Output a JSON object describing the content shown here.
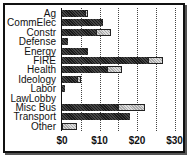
{
  "chart_data": {
    "type": "bar",
    "orientation": "horizontal",
    "stacked": true,
    "title": "",
    "xlabel": "",
    "ylabel": "",
    "categories": [
      "Ag",
      "CommElec",
      "Constr",
      "Defense",
      "Energy",
      "FIRE",
      "Health",
      "Ideology",
      "Labor",
      "LawLobby",
      "Misc Bus",
      "Transport",
      "Other"
    ],
    "series": [
      {
        "name": "dark",
        "color": "#222222",
        "values": [
          6,
          11,
          9,
          1.5,
          7,
          23,
          12,
          4,
          0.8,
          0,
          15,
          18,
          0
        ]
      },
      {
        "name": "light",
        "color": "#cccccc",
        "values": [
          1,
          0,
          4,
          0,
          0,
          4,
          4,
          1,
          0,
          0,
          7,
          0,
          4
        ]
      }
    ],
    "xlim": [
      0,
      30
    ],
    "xticks": [
      "$0",
      "$10",
      "$20",
      "$30"
    ],
    "grid": true,
    "legend": "none"
  }
}
